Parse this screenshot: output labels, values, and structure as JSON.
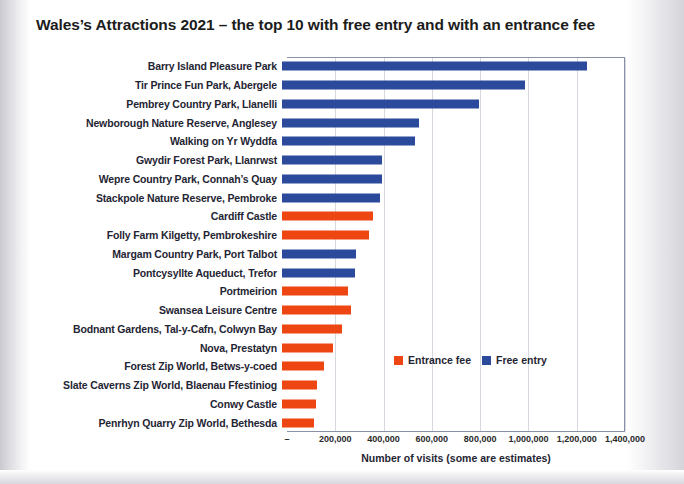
{
  "chart_data": {
    "type": "bar",
    "orientation": "horizontal",
    "title": "Wales’s Attractions 2021 – the top 10 with free entry and with an entrance fee",
    "xlabel": "Number of visits (some are estimates)",
    "ylabel": "",
    "xlim": [
      0,
      1400000
    ],
    "xticks": [
      0,
      200000,
      400000,
      600000,
      800000,
      1000000,
      1200000,
      1400000
    ],
    "xtick_labels": [
      "–",
      "200,000",
      "400,000",
      "600,000",
      "800,000",
      "1,000,000",
      "1,200,000",
      "1,400,000"
    ],
    "grid": "vertical",
    "legend_position": "inside-lower-right",
    "colors": {
      "entrance_fee": "#EE4612",
      "free_entry": "#2B4A9B",
      "gridline": "#D6D8E0",
      "axis": "#8891A6",
      "text": "#1F2533"
    },
    "legend": [
      {
        "label": "Entrance fee",
        "color": "#EE4612"
      },
      {
        "label": "Free entry",
        "color": "#2B4A9B"
      }
    ],
    "categories": [
      "Barry Island Pleasure Park",
      "Tir Prince Fun Park, Abergele",
      "Pembrey Country Park, Llanelli",
      "Newborough Nature Reserve, Anglesey",
      "Walking on Yr Wyddfa",
      "Gwydir Forest Park, Llanrwst",
      "Wepre Country Park, Connah’s Quay",
      "Stackpole Nature Reserve, Pembroke",
      "Cardiff Castle",
      "Folly Farm Kilgetty, Pembrokeshire",
      "Margam Country Park, Port Talbot",
      "Pontcysyllte Aqueduct, Trefor",
      "Portmeirion",
      "Swansea Leisure Centre",
      "Bodnant Gardens, Tal-y-Cafn, Colwyn Bay",
      "Nova, Prestatyn",
      "Forest Zip World, Betws-y-coed",
      "Slate Caverns Zip World, Blaenau Ffestiniog",
      "Conwy Castle",
      "Penrhyn Quarry Zip World, Bethesda"
    ],
    "values": [
      1264000,
      1006000,
      816000,
      567000,
      551000,
      414000,
      414000,
      406000,
      377000,
      360000,
      307000,
      302000,
      273000,
      286000,
      248000,
      211000,
      174000,
      145000,
      141000,
      133000
    ],
    "series_of": [
      "free_entry",
      "free_entry",
      "free_entry",
      "free_entry",
      "free_entry",
      "free_entry",
      "free_entry",
      "free_entry",
      "entrance_fee",
      "entrance_fee",
      "free_entry",
      "free_entry",
      "entrance_fee",
      "entrance_fee",
      "entrance_fee",
      "entrance_fee",
      "entrance_fee",
      "entrance_fee",
      "entrance_fee",
      "entrance_fee"
    ]
  }
}
